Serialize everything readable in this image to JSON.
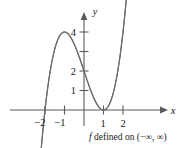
{
  "figure": {
    "name": "cubic-function-graph",
    "caption": {
      "function_symbol": "f",
      "text": " defined on (−∞, ∞)",
      "full": "f defined on (−∞, ∞)"
    },
    "axes": {
      "x_label": "x",
      "y_label": "y",
      "x_ticks": [
        {
          "value": -2,
          "label": "−2"
        },
        {
          "value": -1,
          "label": "−1"
        },
        {
          "value": 1,
          "label": "1"
        },
        {
          "value": 2,
          "label": "2"
        }
      ],
      "y_ticks": [
        {
          "value": 1,
          "label": "1"
        },
        {
          "value": 2,
          "label": "2"
        },
        {
          "value": 3,
          "label": ""
        },
        {
          "value": 4,
          "label": "4"
        }
      ]
    },
    "colors": {
      "curve": "#6b6b6b",
      "axis": "#5a5a5a",
      "text": "#1a1a1a",
      "background": "#ffffff"
    }
  },
  "chart_data": {
    "type": "line",
    "title": "",
    "subtitle": "",
    "xlabel": "x",
    "ylabel": "y",
    "xlim": [
      -2.6,
      2.9
    ],
    "ylim": [
      -0.9,
      5.2
    ],
    "grid": false,
    "legend": null,
    "annotations": [
      "f defined on (−∞, ∞)"
    ],
    "xticks": [
      -2,
      -1,
      1,
      2
    ],
    "xticklabels": [
      "−2",
      "−1",
      "1",
      "2"
    ],
    "yticks": [
      1,
      2,
      3,
      4
    ],
    "yticklabels": [
      "1",
      "2",
      "",
      "4"
    ],
    "series": [
      {
        "name": "f(x) = (x + 2)(x − 1)²",
        "expression": "(x+2)*(x-1)^2",
        "domain": [
          -2.25,
          2.27
        ],
        "roots": [
          -2,
          1
        ],
        "y_intercept": 2,
        "local_max": {
          "x": -1,
          "y": 4
        },
        "local_min": {
          "x": 1,
          "y": 0
        },
        "x": [
          -2.25,
          -2.0,
          -1.75,
          -1.5,
          -1.25,
          -1.0,
          -0.75,
          -0.5,
          -0.25,
          0.0,
          0.25,
          0.5,
          0.75,
          1.0,
          1.25,
          1.5,
          1.75,
          2.0,
          2.25
        ],
        "y": [
          -2.64,
          0.0,
          1.89,
          3.13,
          3.8,
          4.0,
          3.83,
          3.38,
          2.73,
          2.0,
          1.27,
          0.63,
          0.17,
          0.0,
          0.2,
          0.88,
          2.11,
          4.0,
          6.64
        ]
      }
    ]
  }
}
